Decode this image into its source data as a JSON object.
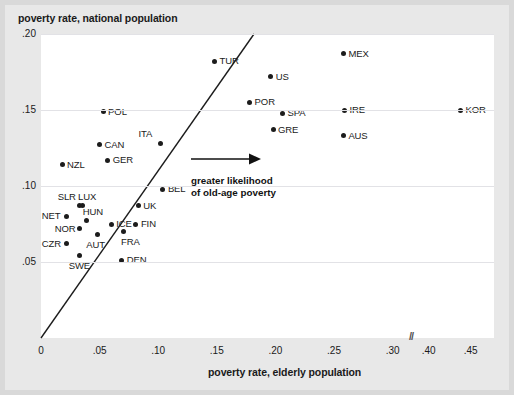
{
  "chart_data": {
    "type": "scatter",
    "title": "",
    "ylabel": "poverty rate, national population",
    "xlabel": "poverty rate, elderly population",
    "xlim": [
      0,
      0.46
    ],
    "ylim": [
      0,
      0.2
    ],
    "grid": true,
    "legend_position": "none",
    "x_ticks": [
      "0",
      ".05",
      ".10",
      ".15",
      ".20",
      ".25",
      ".30",
      ".40",
      ".45"
    ],
    "x_tick_values": [
      0,
      0.05,
      0.1,
      0.15,
      0.2,
      0.25,
      0.3,
      0.4,
      0.45
    ],
    "y_ticks": [
      ".05",
      ".10",
      ".15",
      ".20"
    ],
    "y_tick_values": [
      0.05,
      0.1,
      0.15,
      0.2
    ],
    "axis_break": {
      "symbol": "//",
      "between": [
        0.3,
        0.4
      ]
    },
    "reference_line": {
      "label": "45-degree line",
      "from": [
        0,
        0
      ],
      "to": [
        0.2,
        0.2
      ]
    },
    "annotation": {
      "lines": [
        "greater likelihood",
        "of old-age poverty"
      ],
      "arrow": "right-arrow"
    },
    "points": [
      {
        "label": "TUR",
        "x": 0.148,
        "y": 0.182,
        "label_pos": "right"
      },
      {
        "label": "US",
        "x": 0.196,
        "y": 0.172,
        "label_pos": "right"
      },
      {
        "label": "MEX",
        "x": 0.258,
        "y": 0.187,
        "label_pos": "right"
      },
      {
        "label": "POL",
        "x": 0.053,
        "y": 0.149,
        "label_pos": "right"
      },
      {
        "label": "POR",
        "x": 0.178,
        "y": 0.155,
        "label_pos": "right"
      },
      {
        "label": "SPA",
        "x": 0.206,
        "y": 0.148,
        "label_pos": "right"
      },
      {
        "label": "IRE",
        "x": 0.259,
        "y": 0.15,
        "label_pos": "right"
      },
      {
        "label": "KOR",
        "x": 0.438,
        "y": 0.15,
        "label_pos": "right"
      },
      {
        "label": "ITA",
        "x": 0.102,
        "y": 0.128,
        "label_pos": "above-left"
      },
      {
        "label": "CAN",
        "x": 0.05,
        "y": 0.127,
        "label_pos": "right"
      },
      {
        "label": "GRE",
        "x": 0.198,
        "y": 0.137,
        "label_pos": "right"
      },
      {
        "label": "AUS",
        "x": 0.258,
        "y": 0.133,
        "label_pos": "right"
      },
      {
        "label": "GER",
        "x": 0.057,
        "y": 0.117,
        "label_pos": "right"
      },
      {
        "label": "NZL",
        "x": 0.018,
        "y": 0.114,
        "label_pos": "right"
      },
      {
        "label": "BEL",
        "x": 0.104,
        "y": 0.098,
        "label_pos": "right"
      },
      {
        "label": "LUX",
        "x": 0.035,
        "y": 0.087,
        "label_pos": "above-right"
      },
      {
        "label": "SLR",
        "x": 0.033,
        "y": 0.087,
        "label_pos": "above-left"
      },
      {
        "label": "UK",
        "x": 0.083,
        "y": 0.087,
        "label_pos": "right"
      },
      {
        "label": "NET",
        "x": 0.022,
        "y": 0.08,
        "label_pos": "left"
      },
      {
        "label": "HUN",
        "x": 0.039,
        "y": 0.077,
        "label_pos": "above-right"
      },
      {
        "label": "ICE",
        "x": 0.06,
        "y": 0.075,
        "label_pos": "right"
      },
      {
        "label": "FIN",
        "x": 0.081,
        "y": 0.075,
        "label_pos": "right"
      },
      {
        "label": "NOR",
        "x": 0.033,
        "y": 0.072,
        "label_pos": "left"
      },
      {
        "label": "FRA",
        "x": 0.07,
        "y": 0.07,
        "label_pos": "below-right"
      },
      {
        "label": "AUT",
        "x": 0.048,
        "y": 0.068,
        "label_pos": "below"
      },
      {
        "label": "CZR",
        "x": 0.022,
        "y": 0.062,
        "label_pos": "left"
      },
      {
        "label": "SWE",
        "x": 0.033,
        "y": 0.054,
        "label_pos": "below"
      },
      {
        "label": "DEN",
        "x": 0.069,
        "y": 0.051,
        "label_pos": "right"
      }
    ]
  },
  "labels": {
    "y_axis_title": "poverty rate, national population",
    "x_axis_title": "poverty rate, elderly population",
    "annotation_line1": "greater likelihood",
    "annotation_line2": "of old-age poverty",
    "axis_break_symbol": "//"
  }
}
